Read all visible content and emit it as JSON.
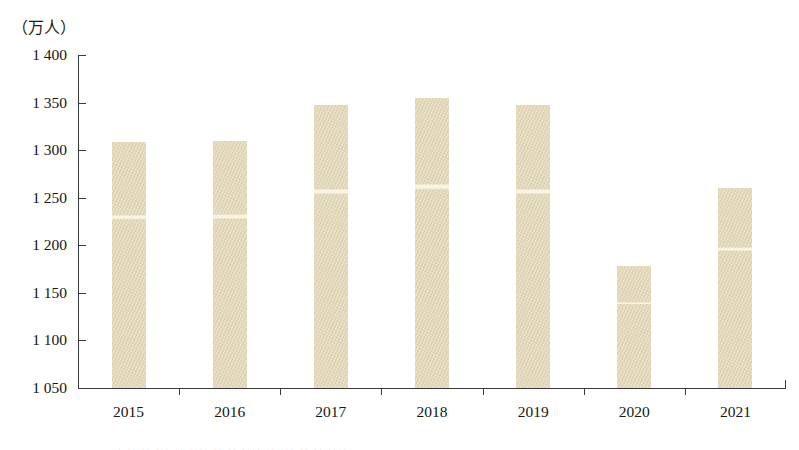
{
  "chart_data": {
    "type": "bar",
    "title": "",
    "subtitle": "",
    "unit_label": "（万人）",
    "xlabel": "",
    "ylabel": "",
    "categories": [
      "2015",
      "2016",
      "2017",
      "2018",
      "2019",
      "2020",
      "2021"
    ],
    "values": [
      1309,
      1310,
      1347,
      1355,
      1347,
      1178,
      1260
    ],
    "ylim": [
      1050,
      1400
    ],
    "yticks": [
      1050,
      1100,
      1150,
      1200,
      1250,
      1300,
      1350,
      1400
    ],
    "ytick_labels": [
      "1 050",
      "1 100",
      "1 150",
      "1 200",
      "1 250",
      "1 300",
      "1 350",
      "1 400"
    ],
    "grid": false,
    "legend": null,
    "series": [
      {
        "name": "",
        "values": [
          1309,
          1310,
          1347,
          1355,
          1347,
          1178,
          1260
        ]
      }
    ],
    "bar_color": "#e2d7b7",
    "axis_color": "#3b3b3b",
    "text_color": "#161616"
  },
  "footer": {
    "ghost_text": "· ·· ·· ··· ·· ···· ·· ·· ···· ·· ··· ·· ·· ····"
  }
}
